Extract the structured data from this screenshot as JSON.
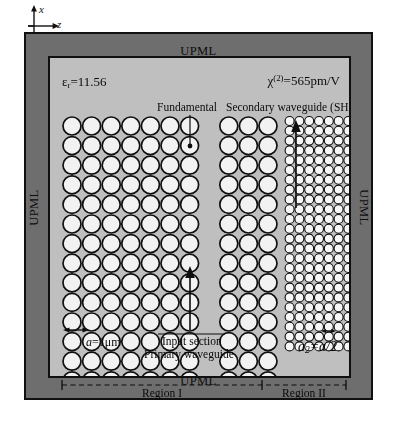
{
  "figure": {
    "type": "schematic-diagram",
    "background_color": "#ffffff"
  },
  "axes": {
    "x_label": "x",
    "z_label": "z",
    "x_direction": "up",
    "z_direction": "right"
  },
  "upml": {
    "label": "UPML",
    "top_label": "UPML",
    "bottom_label": "UPML",
    "left_label": "UPML",
    "right_label": "UPML",
    "color": "#6e6e6e",
    "border_color": "#111111"
  },
  "domain": {
    "background_color": "#bfbfbf",
    "border_color": "#101010"
  },
  "parameters": {
    "permittivity_symbol": "ε",
    "permittivity_subscript": "r",
    "permittivity_value": "11.56",
    "permittivity_text": "εr=11.56",
    "chi_symbol": "χ",
    "chi_superscript": "(2)",
    "chi_value": "565pm/V",
    "chi_text": "χ(2)=565pm/V",
    "lattice_constant_symbol": "a",
    "lattice_constant_value": "1μm",
    "lattice_constant_text": "a=1μm",
    "secondary_lattice_symbol": "a2",
    "secondary_lattice_value": "a/2",
    "secondary_lattice_text": "a2=a/2"
  },
  "annotations": {
    "fundamental": "Fundamental",
    "secondary_waveguide": "Secondary waveguide (SH)",
    "input_section": "Input section",
    "primary_waveguide": "Primary waveguide",
    "region_1": "Region I",
    "region_2": "Region II"
  },
  "lattice": {
    "region1": {
      "rod_fill": "#f2f2f2",
      "rod_stroke": "#101010",
      "radius": 9.0,
      "pitch": 19.6,
      "columns_left_of_guide": 7,
      "columns_right_of_guide": 3,
      "rows": 15
    },
    "region2": {
      "rod_fill": "#f7f7f7",
      "rod_stroke": "#0d0d0d",
      "radius": 4.5,
      "pitch": 9.8,
      "block_a_columns": 9,
      "block_b_columns": 9,
      "rows": 30
    }
  },
  "arrows": {
    "fundamental_input_direction": "up",
    "secondary_output_direction": "up",
    "fundamental_marker": "dot"
  }
}
